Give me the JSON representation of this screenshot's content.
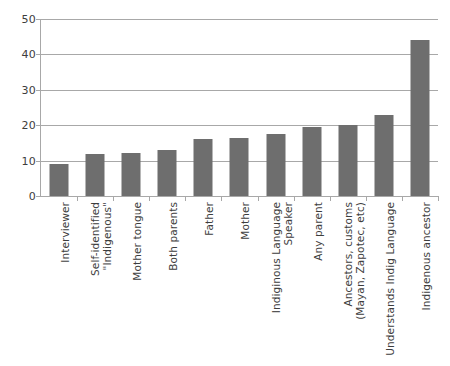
{
  "chart_data": {
    "type": "bar",
    "title": "",
    "subtitle": "",
    "xlabel": "",
    "ylabel": "",
    "ylim": [
      0,
      50
    ],
    "ytick_values": [
      0,
      10,
      20,
      30,
      40,
      50
    ],
    "ytick_labels": [
      "0",
      "10",
      "20",
      "30",
      "40",
      "50"
    ],
    "grid": "horizontal",
    "legend": "none",
    "bar_color": "#6e6e6e",
    "gridline_color": "#a8a8a8",
    "axis_color": "#a8a8a8",
    "categories": [
      "Interviewer",
      "Self-identified \"Indigenous\"",
      "Mother tongue",
      "Both parents",
      "Father",
      "Mother",
      "Indiginous Language Speaker",
      "Any parent",
      "Ancestors, customs (Mayan, Zapotec, etc)",
      "Understands Indig Language",
      "Indigenous ancestor"
    ],
    "category_label_lines": [
      [
        "Interviewer",
        ""
      ],
      [
        "Self-identified",
        "\"Indigenous\""
      ],
      [
        "Mother tongue",
        ""
      ],
      [
        "Both parents",
        ""
      ],
      [
        "Father",
        ""
      ],
      [
        "Mother",
        ""
      ],
      [
        "Indiginous Language",
        "Speaker"
      ],
      [
        "Any parent",
        ""
      ],
      [
        "Ancestors, customs",
        "(Mayan, Zapotec, etc)"
      ],
      [
        "Understands Indig Language",
        ""
      ],
      [
        "Indigenous ancestor",
        ""
      ]
    ],
    "values": [
      9,
      12,
      12.2,
      13,
      16,
      16.5,
      17.5,
      19.5,
      20,
      23,
      44
    ]
  }
}
